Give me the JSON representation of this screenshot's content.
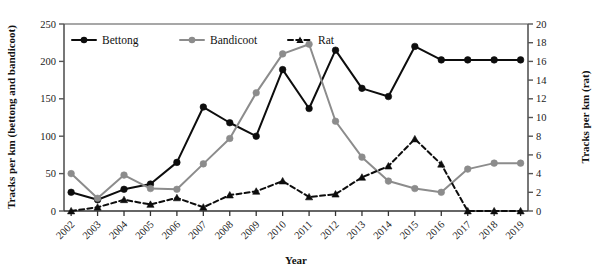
{
  "chart_data": {
    "type": "line",
    "title": "",
    "xlabel": "Year",
    "ylabel": "Tracks per km (bettong and bandicoot)",
    "y2label": "Tracks per km (rat)",
    "categories": [
      "2002",
      "2003",
      "2004",
      "2005",
      "2006",
      "2007",
      "2008",
      "2009",
      "2010",
      "2011",
      "2012",
      "2013",
      "2014",
      "2015",
      "2016",
      "2017",
      "2018",
      "2019"
    ],
    "ylim": [
      0,
      250
    ],
    "yticks": [
      0,
      50,
      100,
      150,
      200,
      250
    ],
    "y2lim": [
      0,
      20
    ],
    "y2ticks": [
      0,
      2,
      4,
      6,
      8,
      10,
      12,
      14,
      16,
      18,
      20
    ],
    "grid": false,
    "legend_position": "top-left-inside",
    "series": [
      {
        "name": "Bettong",
        "axis": "left",
        "color": "#0d0d0d",
        "marker": "circle",
        "dash": "solid",
        "values": [
          25,
          15,
          29,
          36,
          65,
          139,
          118,
          100,
          189,
          137,
          215,
          164,
          153,
          220,
          202,
          202,
          202,
          202
        ]
      },
      {
        "name": "Bandicoot",
        "axis": "left",
        "color": "#8c8c8c",
        "marker": "circle",
        "dash": "solid",
        "values": [
          50,
          17,
          48,
          30,
          29,
          63,
          97,
          158,
          210,
          223,
          120,
          72,
          40,
          30,
          25,
          56,
          64,
          64
        ]
      },
      {
        "name": "Rat",
        "axis": "right",
        "color": "#0d0d0d",
        "marker": "triangle",
        "dash": "dashed",
        "values": [
          0,
          0.4,
          1.2,
          0.7,
          1.4,
          0.4,
          1.7,
          2.1,
          3.2,
          1.5,
          1.8,
          3.6,
          4.8,
          7.7,
          5.0,
          0,
          0,
          0
        ]
      }
    ]
  },
  "axes": {
    "left_title": "Tracks per km (bettong and bandicoot)",
    "right_title": "Tracks per km (rat)",
    "x_title": "Year",
    "left_ticks": [
      "0",
      "50",
      "100",
      "150",
      "200",
      "250"
    ],
    "right_ticks": [
      "0",
      "2",
      "4",
      "6",
      "8",
      "10",
      "12",
      "14",
      "16",
      "18",
      "20"
    ],
    "x_ticks": [
      "2002",
      "2003",
      "2004",
      "2005",
      "2006",
      "2007",
      "2008",
      "2009",
      "2010",
      "2011",
      "2012",
      "2013",
      "2014",
      "2015",
      "2016",
      "2017",
      "2018",
      "2019"
    ]
  },
  "legend": {
    "items": [
      {
        "label": "Bettong"
      },
      {
        "label": "Bandicoot"
      },
      {
        "label": "Rat"
      }
    ]
  },
  "colors": {
    "bettong": "#0d0d0d",
    "bandicoot": "#8c8c8c",
    "rat": "#0d0d0d",
    "axis": "#555555",
    "background": "#ffffff"
  }
}
